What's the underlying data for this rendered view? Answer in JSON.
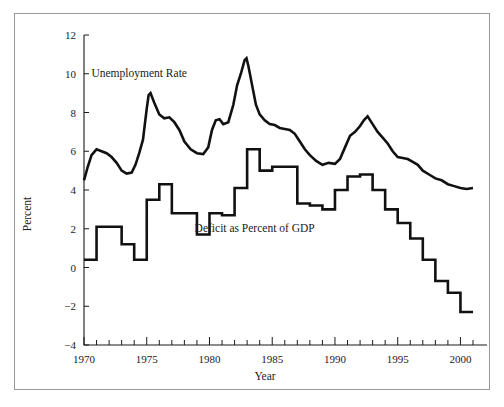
{
  "figure": {
    "frame_border_color": "#9a9a9a",
    "background_color": "#ffffff",
    "line_color": "#111111"
  },
  "chart_data": {
    "type": "line",
    "title": "",
    "subtitle": "",
    "xlabel": "Year",
    "ylabel": "Percent",
    "xlim": [
      1970,
      2001
    ],
    "ylim": [
      -4,
      12
    ],
    "grid": false,
    "legend_position": "inline-annotation",
    "x_ticks_major": [
      1970,
      1975,
      1980,
      1985,
      1990,
      1995,
      2000
    ],
    "x_tick_labels": [
      "1970",
      "1975",
      "1980",
      "1985",
      "1990",
      "1995",
      "2000"
    ],
    "x_minor_tick_step": 1,
    "y_ticks": [
      -4,
      -2,
      0,
      2,
      4,
      6,
      8,
      10,
      12
    ],
    "y_tick_labels": [
      "−4",
      "−2",
      "0",
      "2",
      "4",
      "6",
      "8",
      "10",
      "12"
    ],
    "annotations": [
      {
        "text": "Unemployment Rate",
        "x": 1974.4,
        "y": 9.85
      },
      {
        "text": "Deficit as Percent of GDP",
        "x": 1983.6,
        "y": 1.85
      }
    ],
    "series": [
      {
        "name": "Unemployment Rate",
        "style": "smooth-monthly",
        "x": [
          1970.0,
          1970.3,
          1970.6,
          1971.0,
          1971.4,
          1971.8,
          1972.2,
          1972.6,
          1973.0,
          1973.4,
          1973.8,
          1974.1,
          1974.4,
          1974.7,
          1975.0,
          1975.15,
          1975.3,
          1975.6,
          1976.0,
          1976.4,
          1976.8,
          1977.2,
          1977.6,
          1978.0,
          1978.5,
          1979.0,
          1979.5,
          1979.9,
          1980.2,
          1980.5,
          1980.8,
          1981.1,
          1981.5,
          1981.9,
          1982.2,
          1982.5,
          1982.8,
          1982.95,
          1983.1,
          1983.4,
          1983.7,
          1984.0,
          1984.4,
          1984.8,
          1985.2,
          1985.6,
          1986.0,
          1986.4,
          1986.8,
          1987.2,
          1987.6,
          1988.0,
          1988.5,
          1989.0,
          1989.5,
          1990.0,
          1990.4,
          1990.8,
          1991.2,
          1991.6,
          1992.0,
          1992.3,
          1992.6,
          1993.0,
          1993.4,
          1993.8,
          1994.2,
          1994.6,
          1995.0,
          1995.4,
          1995.8,
          1996.2,
          1996.6,
          1997.0,
          1997.5,
          1998.0,
          1998.5,
          1999.0,
          1999.5,
          2000.0,
          2000.5,
          2001.0
        ],
        "y": [
          4.5,
          5.2,
          5.8,
          6.1,
          6.0,
          5.9,
          5.7,
          5.4,
          5.0,
          4.85,
          4.9,
          5.3,
          5.9,
          6.6,
          8.2,
          8.9,
          9.0,
          8.5,
          7.9,
          7.7,
          7.75,
          7.5,
          7.1,
          6.5,
          6.1,
          5.9,
          5.85,
          6.2,
          7.1,
          7.6,
          7.65,
          7.4,
          7.5,
          8.4,
          9.4,
          10.0,
          10.7,
          10.8,
          10.4,
          9.4,
          8.4,
          7.9,
          7.6,
          7.4,
          7.35,
          7.2,
          7.15,
          7.1,
          6.9,
          6.5,
          6.1,
          5.8,
          5.5,
          5.3,
          5.4,
          5.35,
          5.6,
          6.2,
          6.8,
          7.0,
          7.3,
          7.6,
          7.8,
          7.4,
          7.0,
          6.7,
          6.4,
          6.0,
          5.7,
          5.65,
          5.6,
          5.45,
          5.3,
          5.0,
          4.8,
          4.6,
          4.5,
          4.3,
          4.2,
          4.1,
          4.05,
          4.1
        ]
      },
      {
        "name": "Deficit as Percent of GDP",
        "style": "step-annual",
        "x": [
          1970,
          1971,
          1972,
          1973,
          1974,
          1975,
          1976,
          1977,
          1978,
          1979,
          1980,
          1981,
          1982,
          1983,
          1984,
          1985,
          1986,
          1987,
          1988,
          1989,
          1990,
          1991,
          1992,
          1993,
          1994,
          1995,
          1996,
          1997,
          1998,
          1999,
          2000,
          2001
        ],
        "y": [
          0.4,
          2.1,
          2.1,
          1.2,
          0.4,
          3.5,
          4.3,
          2.8,
          2.8,
          1.7,
          2.8,
          2.7,
          4.1,
          6.1,
          5.0,
          5.2,
          5.2,
          3.3,
          3.2,
          3.0,
          4.0,
          4.7,
          4.8,
          4.0,
          3.0,
          2.3,
          1.5,
          0.4,
          -0.7,
          -1.3,
          -2.3,
          -2.3
        ]
      }
    ]
  }
}
